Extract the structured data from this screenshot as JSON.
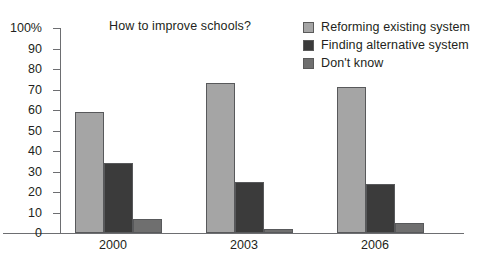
{
  "chart_data": {
    "type": "bar",
    "title": "How to improve schools?",
    "xlabel": "",
    "ylabel": "",
    "categories": [
      "2000",
      "2003",
      "2006"
    ],
    "ylim": [
      0,
      100
    ],
    "yticks": [
      "0",
      "10",
      "20",
      "30",
      "40",
      "50",
      "60",
      "70",
      "80",
      "90",
      "100%"
    ],
    "ytick_values": [
      0,
      10,
      20,
      30,
      40,
      50,
      60,
      70,
      80,
      90,
      100
    ],
    "grid": false,
    "legend_position": "top-right",
    "series": [
      {
        "name": "Reforming existing system",
        "color": "#a5a5a5",
        "values": [
          59,
          73,
          71
        ]
      },
      {
        "name": "Finding alternative system",
        "color": "#3b3b3b",
        "values": [
          34,
          25,
          24
        ]
      },
      {
        "name": "Don't know",
        "color": "#6f6f6f",
        "values": [
          7,
          2,
          5
        ]
      }
    ]
  }
}
